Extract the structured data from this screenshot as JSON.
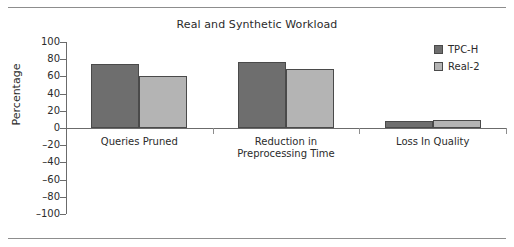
{
  "chart_data": {
    "type": "bar",
    "title": "Real and Synthetic Workload",
    "xlabel": "",
    "ylabel": "Percentage",
    "ylim": [
      -100,
      100
    ],
    "yticks": [
      100,
      80,
      60,
      40,
      20,
      0,
      "–20",
      "–40",
      "–60",
      "–80",
      "–100"
    ],
    "ytick_values": [
      100,
      80,
      60,
      40,
      20,
      0,
      -20,
      -40,
      -60,
      -80,
      -100
    ],
    "grid": false,
    "legend_position": "upper right",
    "categories": [
      "Queries Pruned",
      "Reduction in\nPreprocessing Time",
      "Loss In Quality"
    ],
    "category_lines": [
      [
        "Queries Pruned"
      ],
      [
        "Reduction in",
        "Preprocessing Time"
      ],
      [
        "Loss In Quality"
      ]
    ],
    "series": [
      {
        "name": "TPC-H",
        "color": "#6e6e6e",
        "values": [
          74,
          77,
          8
        ]
      },
      {
        "name": "Real-2",
        "color": "#b4b4b4",
        "values": [
          61,
          69,
          9
        ]
      }
    ]
  },
  "colors": {
    "series_dark": "#6e6e6e",
    "series_light": "#b4b4b4",
    "axis": "#6b6b6b",
    "rule": "#8d8d8d",
    "text": "#2b2b2b",
    "background": "#ffffff"
  }
}
